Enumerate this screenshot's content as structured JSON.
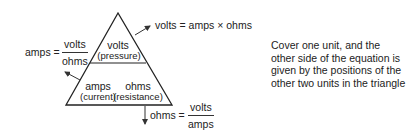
{
  "triangle": {
    "top": {
      "unit": "volts",
      "quantity": "(pressure)"
    },
    "bottom_left": {
      "unit": "amps",
      "quantity": "(current)"
    },
    "bottom_right": {
      "unit": "ohms",
      "quantity": "(resistance)"
    }
  },
  "formulas": {
    "volts": {
      "lhs": "volts",
      "eq": "=",
      "rhs": "amps × ohms"
    },
    "amps": {
      "lhs": "amps",
      "eq": "=",
      "numerator": "volts",
      "denominator": "ohms"
    },
    "ohms": {
      "lhs": "ohms",
      "eq": "=",
      "numerator": "volts",
      "denominator": "amps"
    }
  },
  "note": "Cover one unit, and the other side of the equation is given by the positions of the other two units in the triangle",
  "colors": {
    "line": "#222222",
    "text": "#222222",
    "background": "#ffffff"
  }
}
